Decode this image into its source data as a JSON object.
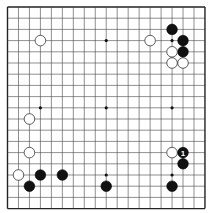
{
  "board": {
    "size": 19,
    "background": "#ffffff",
    "line_color": "#444444",
    "edge_color": "#222222",
    "origin_x": 7.5,
    "origin_y": 7.0,
    "spacing_x": 10.97,
    "spacing_y": 11.2,
    "stone_radius": 5.3,
    "star_points": [
      [
        3,
        3
      ],
      [
        9,
        3
      ],
      [
        15,
        3
      ],
      [
        3,
        9
      ],
      [
        9,
        9
      ],
      [
        15,
        9
      ],
      [
        3,
        15
      ],
      [
        9,
        15
      ],
      [
        15,
        15
      ]
    ]
  },
  "stones": [
    {
      "color": "white",
      "col": 3,
      "row": 3
    },
    {
      "color": "white",
      "col": 13,
      "row": 3
    },
    {
      "color": "black",
      "col": 15,
      "row": 2
    },
    {
      "color": "black",
      "col": 16,
      "row": 3
    },
    {
      "color": "black",
      "col": 16,
      "row": 4
    },
    {
      "color": "white",
      "col": 15,
      "row": 4
    },
    {
      "color": "white",
      "col": 15,
      "row": 5
    },
    {
      "color": "white",
      "col": 16,
      "row": 5
    },
    {
      "color": "white",
      "col": 2,
      "row": 10
    },
    {
      "color": "white",
      "col": 2,
      "row": 13
    },
    {
      "color": "white",
      "col": 1,
      "row": 15
    },
    {
      "color": "black",
      "col": 3,
      "row": 15
    },
    {
      "color": "black",
      "col": 5,
      "row": 15
    },
    {
      "color": "black",
      "col": 2,
      "row": 16
    },
    {
      "color": "black",
      "col": 9,
      "row": 16
    },
    {
      "color": "black",
      "col": 15,
      "row": 16
    },
    {
      "color": "white",
      "col": 15,
      "row": 13
    },
    {
      "color": "black",
      "col": 16,
      "row": 13,
      "label": "1"
    },
    {
      "color": "black",
      "col": 16,
      "row": 14
    }
  ]
}
